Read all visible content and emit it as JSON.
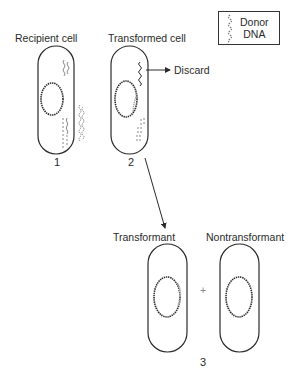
{
  "legend": {
    "icon": "donor-dna-strand-icon",
    "line1": "Donor",
    "line2": "DNA"
  },
  "stages": [
    {
      "number": "1",
      "label": "Recipient cell"
    },
    {
      "number": "2",
      "label": "Transformed cell",
      "discard_label": "Discard"
    },
    {
      "number": "3",
      "cells": [
        {
          "label": "Transformant"
        },
        {
          "label": "Nontransformant"
        }
      ],
      "operator": "+"
    }
  ],
  "colors": {
    "outline": "#2a2a2a",
    "donor_dna": "#8a8a8a"
  }
}
